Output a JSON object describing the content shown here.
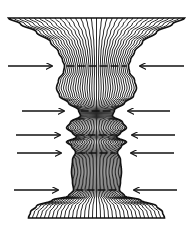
{
  "figure": {
    "width": 193,
    "height": 235,
    "background": "#ffffff",
    "stroke": "#111111",
    "center_x": 96.5,
    "line_count": 34,
    "profile": [
      {
        "y": 18,
        "half": 88
      },
      {
        "y": 24,
        "half": 76
      },
      {
        "y": 32,
        "half": 60
      },
      {
        "y": 42,
        "half": 46
      },
      {
        "y": 52,
        "half": 38
      },
      {
        "y": 60,
        "half": 34
      },
      {
        "y": 66,
        "half": 32
      },
      {
        "y": 72,
        "half": 33
      },
      {
        "y": 80,
        "half": 38
      },
      {
        "y": 88,
        "half": 40
      },
      {
        "y": 96,
        "half": 37
      },
      {
        "y": 103,
        "half": 28
      },
      {
        "y": 110,
        "half": 18
      },
      {
        "y": 116,
        "half": 16
      },
      {
        "y": 122,
        "half": 26
      },
      {
        "y": 128,
        "half": 30
      },
      {
        "y": 133,
        "half": 24
      },
      {
        "y": 137,
        "half": 20
      },
      {
        "y": 142,
        "half": 30
      },
      {
        "y": 146,
        "half": 25
      },
      {
        "y": 152,
        "half": 21
      },
      {
        "y": 160,
        "half": 24
      },
      {
        "y": 172,
        "half": 25
      },
      {
        "y": 182,
        "half": 24
      },
      {
        "y": 190,
        "half": 23
      },
      {
        "y": 196,
        "half": 28
      },
      {
        "y": 200,
        "half": 44
      },
      {
        "y": 206,
        "half": 60
      },
      {
        "y": 212,
        "half": 66
      },
      {
        "y": 218,
        "half": 68
      }
    ],
    "arrows": [
      {
        "y": 66,
        "left_x1": 8,
        "left_x2": 52,
        "right_x1": 184,
        "right_x2": 140
      },
      {
        "y": 111,
        "left_x1": 22,
        "left_x2": 64,
        "right_x1": 170,
        "right_x2": 128
      },
      {
        "y": 135,
        "left_x1": 16,
        "left_x2": 60,
        "right_x1": 175,
        "right_x2": 132
      },
      {
        "y": 153,
        "left_x1": 17,
        "left_x2": 61,
        "right_x1": 174,
        "right_x2": 131
      },
      {
        "y": 190,
        "left_x1": 14,
        "left_x2": 58,
        "right_x1": 177,
        "right_x2": 134
      }
    ],
    "dashes": [
      66,
      111,
      135,
      153,
      190
    ]
  }
}
